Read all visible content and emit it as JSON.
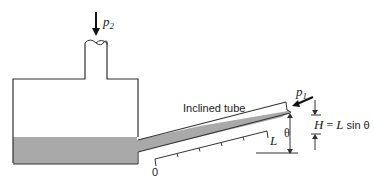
{
  "diagram": {
    "labels": {
      "p2": "p",
      "p2_sub": "2",
      "p1": "p",
      "p1_sub": "1",
      "inclined_tube": "Inclined tube",
      "L": "L",
      "theta": "θ",
      "scale_zero": "0",
      "height_formula_H": "H",
      "height_formula_eq": " = ",
      "height_formula_L": "L",
      "height_formula_sin": " sin θ"
    },
    "colors": {
      "stroke": "#333333",
      "liquid": "#a9a9a9",
      "background": "#ffffff"
    }
  }
}
